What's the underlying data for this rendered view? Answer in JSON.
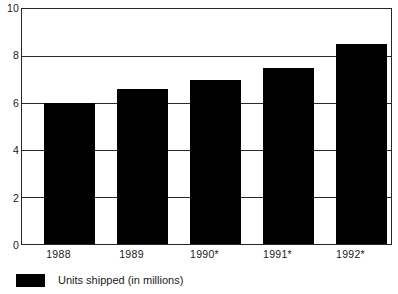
{
  "chart_data": {
    "type": "bar",
    "title": "",
    "subtitle": "",
    "xlabel": "",
    "ylabel": "",
    "categories": [
      "1988",
      "1989",
      "1990*",
      "1991*",
      "1992*"
    ],
    "values": [
      6.0,
      6.6,
      7.0,
      7.5,
      8.5
    ],
    "series": [
      {
        "name": "Units shipped (in millions)",
        "color": "#000000",
        "values": [
          6.0,
          6.6,
          7.0,
          7.5,
          8.5
        ]
      }
    ],
    "ylim": [
      0,
      10
    ],
    "yticks": [
      0,
      2,
      4,
      6,
      8,
      10
    ],
    "ytick_labels": [
      "0",
      "2",
      "4",
      "6",
      "8",
      "10"
    ],
    "grid": "horizontal",
    "legend_position": "bottom-left",
    "legend": [
      {
        "label": "Units shipped (in millions)",
        "color": "#000000"
      }
    ],
    "annotations": []
  },
  "axis": {
    "y_ticks": [
      {
        "label": "10",
        "value": 10
      },
      {
        "label": "8",
        "value": 8
      },
      {
        "label": "6",
        "value": 6
      },
      {
        "label": "4",
        "value": 4
      },
      {
        "label": "2",
        "value": 2
      },
      {
        "label": "0",
        "value": 0
      }
    ],
    "x_ticks": [
      {
        "label": "1988"
      },
      {
        "label": "1989"
      },
      {
        "label": "1990*"
      },
      {
        "label": "1991*"
      },
      {
        "label": "1992*"
      }
    ]
  },
  "legend": {
    "swatch_name": "legend-color-swatch",
    "label": "Units shipped (in millions)"
  }
}
